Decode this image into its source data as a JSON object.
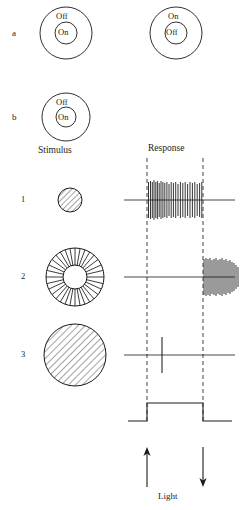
{
  "figure": {
    "panels": [
      {
        "letter": "a"
      },
      {
        "letter": "b"
      }
    ],
    "receptive_fields": [
      {
        "id": "on-center",
        "panel": "a",
        "surround_label": "Off",
        "center_label": "On",
        "cx": 66,
        "cy": 33,
        "r_outer": 26,
        "r_inner": 11
      },
      {
        "id": "off-center",
        "panel": "a",
        "surround_label": "On",
        "center_label": "Off",
        "cx": 176,
        "cy": 33,
        "r_outer": 26,
        "r_inner": 11
      },
      {
        "id": "on-center-stimulus",
        "panel": "b",
        "surround_label": "Off",
        "center_label": "On",
        "cx": 66,
        "cy": 117,
        "r_outer": 24,
        "r_inner": 10
      }
    ],
    "column_headings": {
      "stimulus": "Stimulus",
      "response": "Response"
    },
    "rows": [
      {
        "number": "1",
        "stimulus_icon": "small-hatched-disc",
        "stimulus_desc": "center spot",
        "response_type": "on-burst",
        "baseline_y": 200,
        "spike_count": 26
      },
      {
        "number": "2",
        "stimulus_icon": "hatched-annulus",
        "stimulus_desc": "surround annulus",
        "response_type": "off-burst",
        "baseline_y": 277,
        "spike_count": 18
      },
      {
        "number": "3",
        "stimulus_icon": "large-hatched-disc",
        "stimulus_desc": "full field",
        "response_type": "single-spike",
        "baseline_y": 355,
        "spike_count": 1
      }
    ],
    "light_trace": {
      "label": "Light",
      "on_arrow": "up-arrow",
      "off_arrow": "down-arrow",
      "baseline_y": 421,
      "high_y": 403,
      "start_x": 128,
      "onset_x": 147,
      "offset_x": 203,
      "end_x": 232
    },
    "timing_lines": {
      "onset_x": 147,
      "offset_x": 203,
      "top_y": 158,
      "bottom_y": 424
    },
    "colors": {
      "ink": "#1a1a1a",
      "line": "#333333",
      "dashed": "#2b2b2b"
    }
  }
}
